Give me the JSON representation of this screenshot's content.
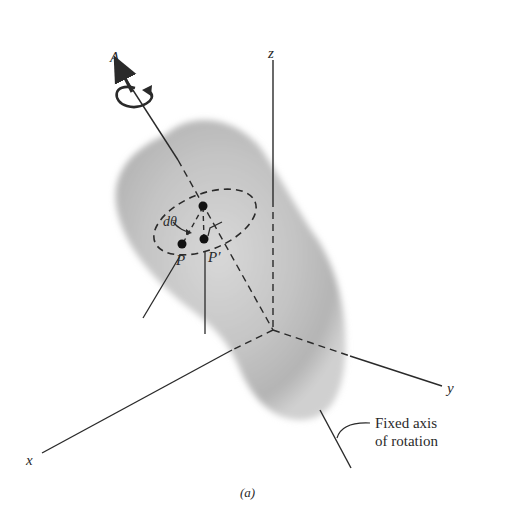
{
  "figure": {
    "caption": "(a)",
    "axes": {
      "x_label": "x",
      "y_label": "y",
      "z_label": "z"
    },
    "rotation_axis_label": "A",
    "angle_label": "dθ",
    "points": {
      "p_label": "P",
      "p_prime_label": "P′"
    },
    "annotation": {
      "line1": "Fixed axis",
      "line2": "of rotation"
    },
    "colors": {
      "ink": "#2a2a2a",
      "body_fill": "#b8b8b8",
      "background": "#ffffff"
    }
  }
}
